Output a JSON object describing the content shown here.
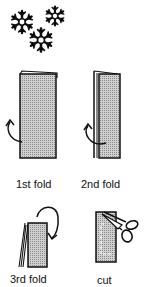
{
  "steps": [
    {
      "id": "fold1",
      "label": "1st fold"
    },
    {
      "id": "fold2",
      "label": "2nd fold"
    },
    {
      "id": "fold3",
      "label": "3rd fold"
    },
    {
      "id": "cut",
      "label": "cut"
    }
  ],
  "colors": {
    "paper_fill": "#b8b8b8",
    "ink": "#111111"
  },
  "icons": [
    "snowflake-icon",
    "fold-arrow-icon",
    "scissors-icon"
  ]
}
